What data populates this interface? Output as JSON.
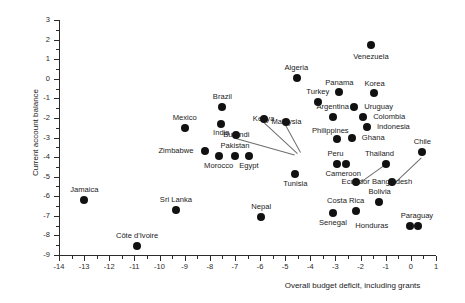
{
  "chart_data": {
    "type": "scatter",
    "title": "",
    "xlabel": "Overall budget deficit, including grants",
    "ylabel": "Current account balance",
    "xlim": [
      -14,
      1
    ],
    "ylim": [
      -9,
      3
    ],
    "xticks": [
      "-14",
      "-13",
      "-12",
      "-11",
      "-10",
      "-9",
      "-8",
      "-7",
      "-6",
      "-5",
      "-4",
      "-3",
      "-2",
      "-1",
      "0",
      "1"
    ],
    "yticks": [
      "3",
      "2",
      "1",
      "0",
      "-1",
      "-2",
      "-3",
      "-4",
      "-5",
      "-6",
      "-7",
      "-8",
      "-9"
    ],
    "grid": false,
    "legend": null,
    "marker_color": "#111111",
    "points": [
      {
        "label": "Venezuela",
        "x": -1.6,
        "y": 1.7,
        "lx": -1.6,
        "ly": 1.1,
        "anchor": "center"
      },
      {
        "label": "Algeria",
        "x": -4.55,
        "y": 0.05,
        "lx": -4.55,
        "ly": 0.55,
        "anchor": "center"
      },
      {
        "label": "Panama",
        "x": -2.85,
        "y": -0.7,
        "lx": -2.85,
        "ly": -0.2,
        "anchor": "center"
      },
      {
        "label": "Korea",
        "x": -1.45,
        "y": -0.75,
        "lx": -1.45,
        "ly": -0.25,
        "anchor": "center"
      },
      {
        "label": "Turkey",
        "x": -3.7,
        "y": -1.2,
        "lx": -3.7,
        "ly": -0.7,
        "anchor": "center"
      },
      {
        "label": "Uruguay",
        "x": -2.25,
        "y": -1.45,
        "lx": -2.05,
        "ly": -1.45,
        "anchor": "left"
      },
      {
        "label": "Brazil",
        "x": -7.5,
        "y": -1.45,
        "lx": -7.5,
        "ly": -0.95,
        "anchor": "center"
      },
      {
        "label": "Argentina",
        "x": -3.1,
        "y": -1.95,
        "lx": -3.1,
        "ly": -1.45,
        "anchor": "center"
      },
      {
        "label": "Colombia",
        "x": -1.9,
        "y": -1.95,
        "lx": -1.7,
        "ly": -1.95,
        "anchor": "left"
      },
      {
        "label": "Mexico",
        "x": -9.0,
        "y": -2.5,
        "lx": -9.0,
        "ly": -2.0,
        "anchor": "center"
      },
      {
        "label": "India",
        "x": -7.55,
        "y": -2.3,
        "lx": -7.55,
        "ly": -2.75,
        "anchor": "center"
      },
      {
        "label": "Indonesia",
        "x": -1.75,
        "y": -2.45,
        "lx": -1.55,
        "ly": -2.45,
        "anchor": "left"
      },
      {
        "label": "Philippines",
        "x": -2.95,
        "y": -3.1,
        "lx": -3.2,
        "ly": -2.65,
        "anchor": "center"
      },
      {
        "label": "Ghana",
        "x": -2.35,
        "y": -3.0,
        "lx": -2.15,
        "ly": -3.0,
        "anchor": "left"
      },
      {
        "label": "Burundi",
        "x": -6.95,
        "y": -2.85,
        "lx": -6.95,
        "ly": -2.85,
        "anchor": "center",
        "leader": {
          "to_x": -4.6,
          "to_y": -3.85
        }
      },
      {
        "label": "Kenya",
        "x": -5.85,
        "y": -2.05,
        "lx": -5.85,
        "ly": -2.05,
        "anchor": "center",
        "leader": {
          "to_x": -4.5,
          "to_y": -3.8
        }
      },
      {
        "label": "Malaysia",
        "x": -4.95,
        "y": -2.2,
        "lx": -4.95,
        "ly": -2.2,
        "anchor": "center",
        "leader": {
          "to_x": -4.35,
          "to_y": -3.75
        }
      },
      {
        "label": "Zimbabwe",
        "x": -8.2,
        "y": -3.7,
        "lx": -8.45,
        "ly": -3.7,
        "anchor": "right"
      },
      {
        "label": "Pakistan",
        "x": -7.0,
        "y": -3.95,
        "lx": -7.0,
        "ly": -3.45,
        "anchor": "center"
      },
      {
        "label": "Morocco",
        "x": -7.65,
        "y": -3.95,
        "lx": -7.65,
        "ly": -4.45,
        "anchor": "center"
      },
      {
        "label": "Egypt",
        "x": -6.45,
        "y": -3.95,
        "lx": -6.45,
        "ly": -4.45,
        "anchor": "center"
      },
      {
        "label": "Chile",
        "x": 0.45,
        "y": -3.75,
        "lx": 0.45,
        "ly": -3.25,
        "anchor": "center"
      },
      {
        "label": "Peru",
        "x": -2.95,
        "y": -4.35,
        "lx": -3.0,
        "ly": -3.85,
        "anchor": "center"
      },
      {
        "label": "Cameroon",
        "x": -2.6,
        "y": -4.35,
        "lx": -2.7,
        "ly": -4.85,
        "anchor": "center"
      },
      {
        "label": "Thailand",
        "x": -1.0,
        "y": -4.35,
        "lx": -1.25,
        "ly": -3.85,
        "anchor": "center"
      },
      {
        "label": "Tunisia",
        "x": -4.6,
        "y": -4.85,
        "lx": -4.6,
        "ly": -5.35,
        "anchor": "center"
      },
      {
        "label": "Ecuador",
        "x": -2.2,
        "y": -5.25,
        "lx": -2.2,
        "ly": -5.25,
        "anchor": "center",
        "leader": {
          "to_x": -1.1,
          "to_y": -4.4
        }
      },
      {
        "label": "Bangladesh",
        "x": -0.75,
        "y": -5.25,
        "lx": -0.75,
        "ly": -5.25,
        "anchor": "center",
        "leader": {
          "to_x": 0.4,
          "to_y": -4.0
        }
      },
      {
        "label": "Jamaica",
        "x": -13.0,
        "y": -6.2,
        "lx": -13.0,
        "ly": -5.7,
        "anchor": "center"
      },
      {
        "label": "Sri Lanka",
        "x": -9.35,
        "y": -6.7,
        "lx": -9.35,
        "ly": -6.2,
        "anchor": "center"
      },
      {
        "label": "Bolivia",
        "x": -1.25,
        "y": -6.3,
        "lx": -1.25,
        "ly": -5.8,
        "anchor": "center"
      },
      {
        "label": "Costa Rica",
        "x": -2.2,
        "y": -6.75,
        "lx": -2.6,
        "ly": -6.25,
        "anchor": "center"
      },
      {
        "label": "Nepal",
        "x": -5.95,
        "y": -7.05,
        "lx": -5.95,
        "ly": -6.55,
        "anchor": "center"
      },
      {
        "label": "Senegal",
        "x": -3.1,
        "y": -6.85,
        "lx": -3.1,
        "ly": -7.35,
        "anchor": "center"
      },
      {
        "label": "Honduras",
        "x": -0.05,
        "y": -7.5,
        "lx": -0.7,
        "ly": -7.5,
        "anchor": "right"
      },
      {
        "label": "Paraguay",
        "x": 0.3,
        "y": -7.5,
        "lx": 0.25,
        "ly": -7.0,
        "anchor": "center"
      },
      {
        "label": "Côte d'Ivoire",
        "x": -10.9,
        "y": -8.55,
        "lx": -10.9,
        "ly": -8.05,
        "anchor": "center"
      }
    ]
  }
}
